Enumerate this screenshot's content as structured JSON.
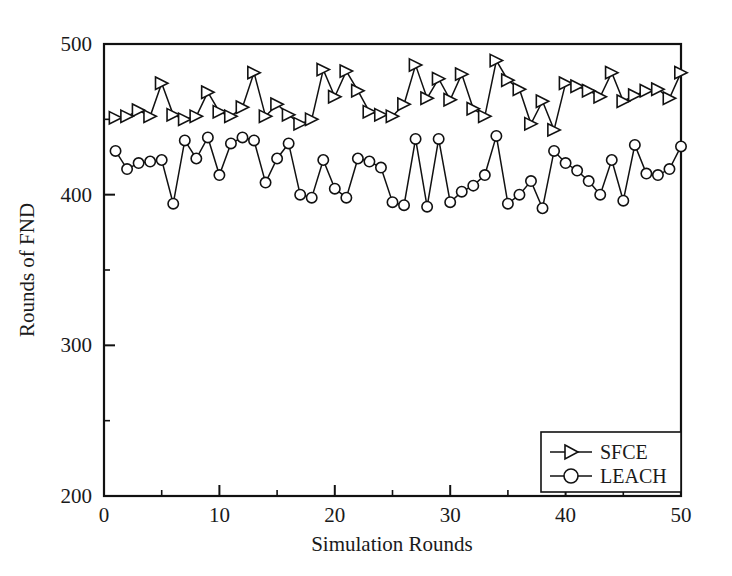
{
  "chart_data": {
    "type": "line",
    "title": "",
    "xlabel": "Simulation Rounds",
    "ylabel": "Rounds of FND",
    "xlim": [
      0,
      50
    ],
    "ylim": [
      200,
      500
    ],
    "grid": false,
    "legend_position": "bottom-right",
    "x_ticks": [
      0,
      10,
      20,
      30,
      40,
      50
    ],
    "x_tick_labels": [
      "0",
      "10",
      "20",
      "30",
      "40",
      "50"
    ],
    "x_minor_ticks": [
      5,
      15,
      25,
      35,
      45
    ],
    "y_ticks": [
      200,
      300,
      400,
      500
    ],
    "y_tick_labels": [
      "200",
      "300",
      "400",
      "500"
    ],
    "y_minor_ticks": [
      250,
      350,
      450
    ],
    "x": [
      1,
      2,
      3,
      4,
      5,
      6,
      7,
      8,
      9,
      10,
      11,
      12,
      13,
      14,
      15,
      16,
      17,
      18,
      19,
      20,
      21,
      22,
      23,
      24,
      25,
      26,
      27,
      28,
      29,
      30,
      31,
      32,
      33,
      34,
      35,
      36,
      37,
      38,
      39,
      40,
      41,
      42,
      43,
      44,
      45,
      46,
      47,
      48,
      49,
      50
    ],
    "series": [
      {
        "name": "SFCE",
        "marker": "triangle-right",
        "values": [
          451,
          452,
          456,
          452,
          474,
          453,
          450,
          452,
          468,
          455,
          452,
          458,
          481,
          452,
          460,
          453,
          447,
          450,
          483,
          465,
          482,
          469,
          455,
          453,
          452,
          460,
          486,
          464,
          477,
          463,
          480,
          457,
          452,
          489,
          476,
          470,
          447,
          462,
          443,
          474,
          472,
          469,
          465,
          481,
          462,
          466,
          469,
          470,
          464,
          481
        ]
      },
      {
        "name": "LEACH",
        "marker": "circle",
        "values": [
          429,
          417,
          421,
          422,
          423,
          394,
          436,
          424,
          438,
          413,
          434,
          438,
          436,
          408,
          424,
          434,
          400,
          398,
          423,
          404,
          398,
          424,
          422,
          418,
          395,
          393,
          437,
          392,
          437,
          395,
          402,
          406,
          413,
          439,
          394,
          400,
          409,
          391,
          429,
          421,
          416,
          409,
          400,
          423,
          396,
          433,
          414,
          413,
          417,
          432
        ]
      }
    ]
  },
  "legend": {
    "entries": [
      {
        "label": "SFCE",
        "marker": "triangle-right-marker"
      },
      {
        "label": "LEACH",
        "marker": "circle-marker"
      }
    ]
  },
  "colors": {
    "line": "#111111",
    "marker_fill": "#ffffff",
    "axis": "#111111",
    "background": "#ffffff",
    "text": "#1a1a1a"
  }
}
